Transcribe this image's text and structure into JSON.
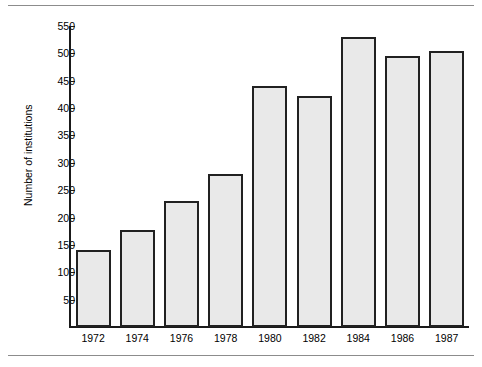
{
  "figure": {
    "has_top_rule": true,
    "has_bottom_rule": true,
    "rule_color": "#8c8c8c",
    "background": "#ffffff"
  },
  "chart_data": {
    "type": "bar",
    "title": "",
    "xlabel": "",
    "ylabel": "Number of institutions",
    "categories": [
      "1972",
      "1974",
      "1976",
      "1978",
      "1980",
      "1982",
      "1984",
      "1986",
      "1987"
    ],
    "values": [
      140,
      177,
      230,
      280,
      440,
      423,
      530,
      495,
      505
    ],
    "ylim": [
      0,
      550
    ],
    "ytick_labels": [
      "50",
      "100",
      "150",
      "200",
      "250",
      "300",
      "350",
      "400",
      "450",
      "500",
      "550"
    ],
    "ytick_values": [
      50,
      100,
      150,
      200,
      250,
      300,
      350,
      400,
      450,
      500,
      550
    ],
    "grid": false,
    "legend": null,
    "bar_fill_color": "#e9e9e9",
    "bar_edge_color": "#212121",
    "axis_color": "#1a1a1a"
  }
}
